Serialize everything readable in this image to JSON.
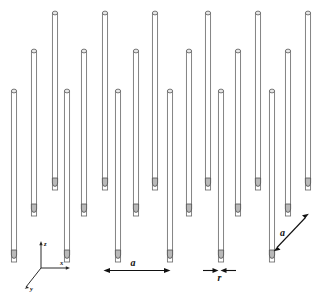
{
  "figure": {
    "type": "3d-schematic-diagram",
    "background_color": "#ffffff",
    "stroke_color": "#6e6e6e",
    "cap_fill": "#e8e8e8",
    "foot_fill": "#b9b9b9"
  },
  "axes": {
    "z": {
      "label": "z",
      "direction": "up"
    },
    "x": {
      "label": "x",
      "direction": "right"
    },
    "y": {
      "label": "y",
      "direction": "down-left"
    },
    "origin": {
      "x": 41,
      "y": 268
    }
  },
  "dimensions": [
    {
      "id": "lattice-x",
      "label": "a",
      "orientation": "horizontal",
      "description": "in-plane lattice constant along x",
      "arrow": "double-headed",
      "x1": 104,
      "x2": 170,
      "y": 270
    },
    {
      "id": "rod-radius",
      "label": "r",
      "orientation": "horizontal",
      "description": "rod radius",
      "arrow": "double-headed-inward",
      "x1": 206,
      "x2": 232,
      "y": 270
    },
    {
      "id": "lattice-y",
      "label": "a",
      "orientation": "diagonal",
      "description": "lattice constant along y (depth direction)",
      "arrow": "double-headed",
      "x1": 274,
      "y1": 251,
      "x2": 308,
      "y2": 214
    }
  ],
  "lattice": {
    "rows": 3,
    "columns": 6,
    "row_labels": [
      "back",
      "middle",
      "front"
    ],
    "rod_count": 18,
    "rod_width": 5.2,
    "rows_detail": [
      {
        "name": "back",
        "top_y": 10,
        "bottom_y": 190,
        "x_positions": [
          55,
          105,
          155,
          208,
          258,
          308
        ]
      },
      {
        "name": "middle",
        "top_y": 48,
        "bottom_y": 216,
        "x_positions": [
          34,
          84,
          136,
          189,
          238,
          288
        ]
      },
      {
        "name": "front",
        "top_y": 88,
        "bottom_y": 262,
        "x_positions": [
          14,
          67,
          118,
          170,
          221,
          272
        ]
      }
    ]
  }
}
